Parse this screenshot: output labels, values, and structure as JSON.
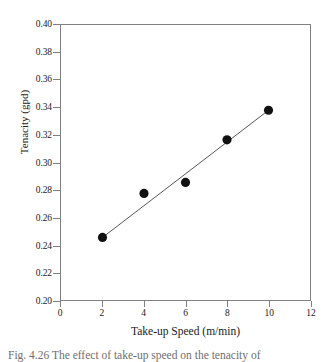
{
  "figure": {
    "background_color": "#ffffff",
    "frame_color": "#808080",
    "marker_color": "#101010",
    "line_color": "#555555"
  },
  "caption": {
    "text": "Fig. 4.26   The effect of take-up speed on the tenacity of"
  },
  "chart_data": {
    "type": "scatter",
    "title": "",
    "xlabel": "Take-up Speed (m/min)",
    "ylabel": "Tenacity (gpd)",
    "xlim": [
      0,
      12
    ],
    "ylim": [
      0.2,
      0.4
    ],
    "grid": false,
    "legend": null,
    "xticks": [
      0,
      2,
      4,
      6,
      8,
      10,
      12
    ],
    "xtick_labels": [
      "0",
      "2",
      "4",
      "6",
      "8",
      "10",
      "12"
    ],
    "yticks": [
      0.2,
      0.22,
      0.24,
      0.26,
      0.28,
      0.3,
      0.32,
      0.34,
      0.36,
      0.38,
      0.4
    ],
    "ytick_labels": [
      "0.20",
      "0.22",
      "0.24",
      "0.26",
      "0.28",
      "0.30",
      "0.32",
      "0.34",
      "0.36",
      "0.38",
      "0.40"
    ],
    "series": [
      {
        "name": "Tenacity",
        "marker": "filled-circle",
        "x": [
          2,
          4,
          6,
          8,
          10
        ],
        "y": [
          0.2455,
          0.2775,
          0.2855,
          0.3165,
          0.338
        ]
      },
      {
        "name": "Linear fit",
        "marker": "none",
        "type": "line",
        "x": [
          2,
          10
        ],
        "y": [
          0.2455,
          0.338
        ]
      }
    ]
  }
}
